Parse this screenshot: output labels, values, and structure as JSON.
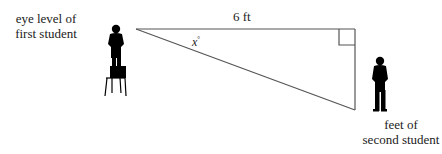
{
  "labels": {
    "first_student": [
      "eye level of",
      "first student"
    ],
    "second_student": [
      "feet of",
      "second student"
    ],
    "distance": "6 ft",
    "angle_var": "x",
    "angle_unit": "°"
  },
  "triangle": {
    "vertices": {
      "eye_level": [
        136,
        29
      ],
      "right_angle": [
        355,
        29
      ],
      "feet": [
        355,
        110
      ]
    },
    "right_angle_marker_size": 16,
    "stroke_color": "#555555"
  },
  "figures": {
    "first_student": "person standing on chair",
    "second_student": "person standing"
  }
}
